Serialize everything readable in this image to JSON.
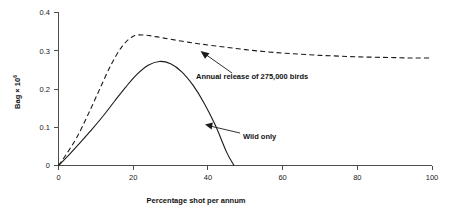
{
  "chart_data": {
    "type": "line",
    "title": "",
    "subtitle": "",
    "xlabel": "Percentage shot per annum",
    "ylabel": "Bag  ×  10",
    "ylabel_exponent": "6",
    "xlim": [
      0,
      100
    ],
    "ylim": [
      0,
      0.4
    ],
    "xticks": [
      0,
      20,
      40,
      60,
      80,
      100
    ],
    "xtick_labels": [
      "0",
      "20",
      "40",
      "60",
      "80",
      "100"
    ],
    "yticks": [
      0,
      0.1,
      0.2,
      0.3,
      0.4
    ],
    "ytick_labels": [
      "0",
      "0.1",
      "0.2",
      "0.3",
      "0.4"
    ],
    "grid": false,
    "legend_position": "inline-annotations",
    "series": [
      {
        "name": "Annual release of 275,000 birds",
        "style": "dashed",
        "x": [
          0,
          2,
          5,
          8,
          11,
          14,
          17,
          20,
          23,
          26,
          30,
          35,
          40,
          45,
          50,
          55,
          60,
          65,
          70,
          75,
          80,
          85,
          90,
          95,
          100
        ],
        "y": [
          0,
          0.028,
          0.075,
          0.135,
          0.199,
          0.262,
          0.311,
          0.338,
          0.341,
          0.337,
          0.33,
          0.322,
          0.315,
          0.309,
          0.303,
          0.298,
          0.294,
          0.291,
          0.288,
          0.286,
          0.284,
          0.283,
          0.282,
          0.281,
          0.281
        ]
      },
      {
        "name": "Wild only",
        "style": "solid",
        "x": [
          0,
          3,
          6,
          9,
          12,
          15,
          18,
          21,
          24,
          27,
          30,
          33,
          36,
          39,
          42,
          45,
          47
        ],
        "y": [
          0,
          0.03,
          0.062,
          0.095,
          0.13,
          0.168,
          0.205,
          0.238,
          0.262,
          0.272,
          0.266,
          0.245,
          0.21,
          0.163,
          0.105,
          0.035,
          0.0
        ]
      }
    ],
    "annotations": [
      {
        "name": "release-annotation",
        "text": "Annual release of 275,000 birds",
        "x": 37,
        "y": 0.228,
        "points_to_x": 19.5,
        "points_to_y": 0.295
      },
      {
        "name": "wild-only-annotation",
        "text": "Wild only",
        "x": 33,
        "y": 0.113,
        "points_to_x": 21.5,
        "points_to_y": 0.122
      }
    ]
  }
}
